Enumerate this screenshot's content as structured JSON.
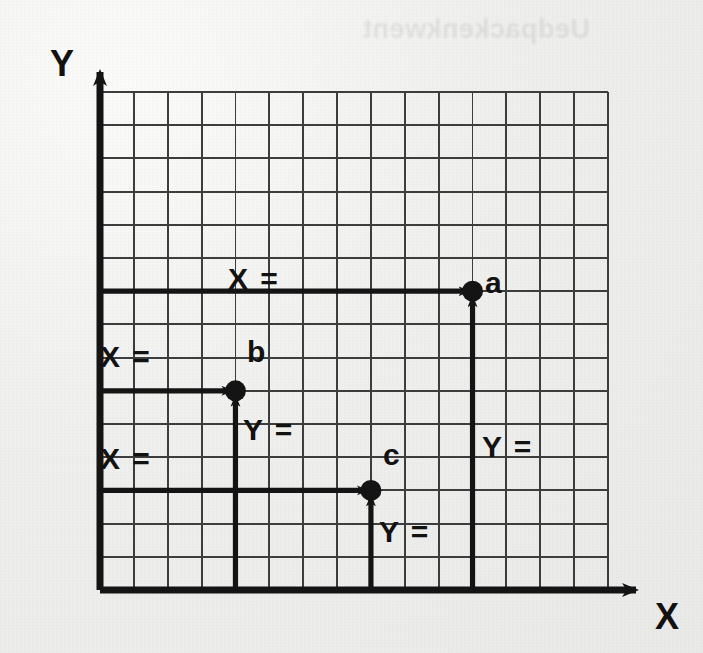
{
  "figure": {
    "kind": "coordinate-grid-worksheet",
    "background_color": "#efefed",
    "ink_color": "#141414",
    "grid_line_color": "#3a3a3a",
    "bleed_through_text": "Uedpackenkwent",
    "axes": {
      "x_label": "X",
      "y_label": "Y",
      "origin_px": {
        "x": 100,
        "y": 590
      }
    },
    "grid": {
      "columns": 15,
      "rows": 15,
      "cell_px": 33.87,
      "left_px": 100,
      "top_px": 92,
      "right_px": 608,
      "bottom_px": 590
    },
    "points": [
      {
        "id": "a",
        "label": "a",
        "grid": {
          "col": 11,
          "row": 9
        },
        "px": {
          "x": 472,
          "y": 296
        },
        "x_label": "X =",
        "y_label": "Y =",
        "x_label_px": {
          "x": 228,
          "y": 264
        },
        "y_label_px": {
          "x": 482,
          "y": 432
        }
      },
      {
        "id": "b",
        "label": "b",
        "grid": {
          "col": 4,
          "row": 6
        },
        "px": {
          "x": 235,
          "y": 364
        },
        "x_label": "X =",
        "y_label": "Y =",
        "x_label_px": {
          "x": 102,
          "y": 342
        },
        "y_label_px": {
          "x": 245,
          "y": 415
        }
      },
      {
        "id": "c",
        "label": "c",
        "grid": {
          "col": 8,
          "row": 3
        },
        "px": {
          "x": 371,
          "y": 466
        },
        "x_label": "X =",
        "y_label": "Y =",
        "x_label_px": {
          "x": 102,
          "y": 444
        },
        "y_label_px": {
          "x": 381,
          "y": 517
        }
      }
    ]
  }
}
